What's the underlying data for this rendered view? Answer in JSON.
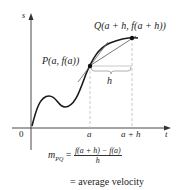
{
  "diagram": {
    "axes": {
      "y_label": "s",
      "x_label": "t",
      "origin_label": "0",
      "x_ticks": [
        "a",
        "a + h"
      ]
    },
    "points": {
      "P": {
        "label": "P(a, f(a))"
      },
      "Q": {
        "label": "Q(a + h, f(a + h))"
      }
    },
    "interval_label": "h",
    "formula": {
      "lhs": "m",
      "lhs_sub": "PQ",
      "equals": "=",
      "numerator": "f(a + h) − f(a)",
      "denominator": "h",
      "result": "= average velocity"
    },
    "colors": {
      "curve": "#1a1a1a",
      "secant": "#555555",
      "guides": "#bbbbbb"
    }
  }
}
